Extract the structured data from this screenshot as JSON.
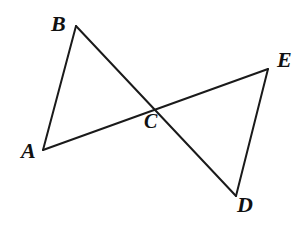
{
  "figure": {
    "type": "geometry-diagram",
    "canvas": {
      "width": 303,
      "height": 225
    },
    "background_color": "#ffffff",
    "line_color": "#1a1a1a",
    "line_width": 2,
    "label_color": "#111111",
    "points": {
      "A": {
        "name": "A",
        "x": 43,
        "y": 150
      },
      "B": {
        "name": "B",
        "x": 76,
        "y": 26
      },
      "C": {
        "name": "C",
        "x": 152,
        "y": 108
      },
      "D": {
        "name": "D",
        "x": 236,
        "y": 196
      },
      "E": {
        "name": "E",
        "x": 268,
        "y": 69
      }
    },
    "labels": [
      {
        "text": "A",
        "x": 21,
        "y": 140
      },
      {
        "text": "B",
        "x": 51,
        "y": 13
      },
      {
        "text": "C",
        "x": 144,
        "y": 111
      },
      {
        "text": "D",
        "x": 237,
        "y": 194
      },
      {
        "text": "E",
        "x": 277,
        "y": 49
      }
    ],
    "segments": [
      {
        "name": "segment-AB",
        "from": "A",
        "to": "B",
        "path": "M 43 150 L 76 26"
      },
      {
        "name": "segment-AE",
        "from": "A",
        "to": "E",
        "path": "M 43 150 L 268 69"
      },
      {
        "name": "segment-BD",
        "from": "B",
        "to": "D",
        "path": "M 76 26 L 236 196"
      },
      {
        "name": "segment-DE",
        "from": "D",
        "to": "E",
        "path": "M 236 196 L 268 69"
      }
    ]
  }
}
